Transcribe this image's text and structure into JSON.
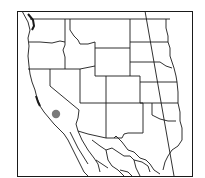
{
  "map": {
    "type": "outline-range-map",
    "region": "Western United States and northern Mexico",
    "background": "#ffffff",
    "line_color": "#1a1a1a",
    "marker": {
      "label": "",
      "shape": "circle",
      "color": "#7a7a7a",
      "cx": 56,
      "cy": 114,
      "r": 4.2,
      "location_description": "Central California"
    },
    "frame": {
      "x": 17,
      "y": 11,
      "w": 176,
      "h": 166
    }
  }
}
